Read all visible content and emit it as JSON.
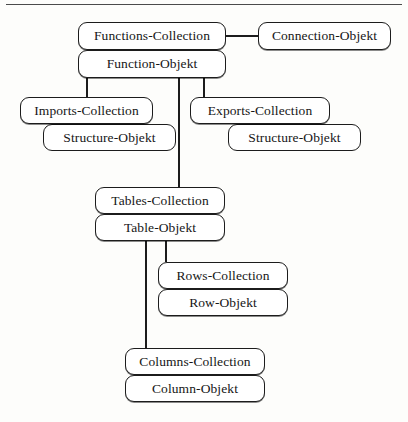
{
  "diagram": {
    "type": "object-model-hierarchy-tree",
    "background_color": "#fdfdfb",
    "node_fill_color": "#ffffff",
    "node_border_color": "#1c1c1c",
    "text_color": "#161616",
    "nodes": [
      {
        "id": "functions_collection",
        "label": "Functions-Collection",
        "kind": "collection",
        "x": 78,
        "y": 22,
        "w": 148,
        "h": 28
      },
      {
        "id": "connection_objekt",
        "label": "Connection-Objekt",
        "kind": "object",
        "x": 258,
        "y": 22,
        "w": 133,
        "h": 28
      },
      {
        "id": "function_objekt",
        "label": "Function-Objekt",
        "kind": "object",
        "x": 78,
        "y": 50,
        "w": 148,
        "h": 28
      },
      {
        "id": "imports_collection",
        "label": "Imports-Collection",
        "kind": "collection",
        "x": 20,
        "y": 97,
        "w": 133,
        "h": 27
      },
      {
        "id": "exports_collection",
        "label": "Exports-Collection",
        "kind": "collection",
        "x": 190,
        "y": 97,
        "w": 140,
        "h": 27
      },
      {
        "id": "imports_structure",
        "label": "Structure-Objekt",
        "kind": "object",
        "x": 43,
        "y": 124,
        "w": 133,
        "h": 27
      },
      {
        "id": "exports_structure",
        "label": "Structure-Objekt",
        "kind": "object",
        "x": 228,
        "y": 124,
        "w": 133,
        "h": 27
      },
      {
        "id": "tables_collection",
        "label": "Tables-Collection",
        "kind": "collection",
        "x": 95,
        "y": 187,
        "w": 130,
        "h": 27
      },
      {
        "id": "table_objekt",
        "label": "Table-Objekt",
        "kind": "object",
        "x": 95,
        "y": 214,
        "w": 130,
        "h": 27
      },
      {
        "id": "rows_collection",
        "label": "Rows-Collection",
        "kind": "collection",
        "x": 158,
        "y": 262,
        "w": 130,
        "h": 27
      },
      {
        "id": "row_objekt",
        "label": "Row-Objekt",
        "kind": "object",
        "x": 158,
        "y": 289,
        "w": 130,
        "h": 27
      },
      {
        "id": "columns_collection",
        "label": "Columns-Collection",
        "kind": "collection",
        "x": 125,
        "y": 348,
        "w": 140,
        "h": 27
      },
      {
        "id": "column_objekt",
        "label": "Column-Objekt",
        "kind": "object",
        "x": 125,
        "y": 375,
        "w": 140,
        "h": 27
      }
    ],
    "edges": [
      {
        "id": "functions_to_connection",
        "from": "functions_collection",
        "to": "connection_objekt"
      },
      {
        "id": "function_to_imports",
        "from": "function_objekt",
        "to": "imports_collection"
      },
      {
        "id": "function_to_exports",
        "from": "function_objekt",
        "to": "exports_collection"
      },
      {
        "id": "function_to_tables",
        "from": "function_objekt",
        "to": "tables_collection"
      },
      {
        "id": "table_to_rows",
        "from": "table_objekt",
        "to": "rows_collection"
      },
      {
        "id": "table_to_columns",
        "from": "table_objekt",
        "to": "columns_collection"
      }
    ]
  }
}
